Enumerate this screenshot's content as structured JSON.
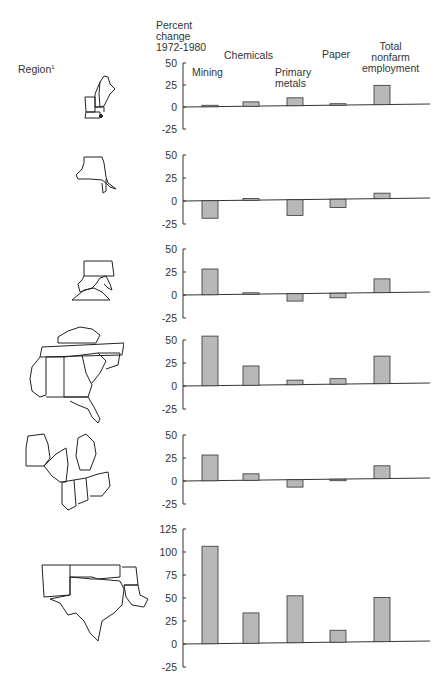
{
  "header": {
    "y_label_lines": [
      "Percent",
      "change",
      "1972-1980"
    ],
    "region_label": "Region",
    "region_footnote": "1",
    "categories": [
      {
        "key": "mining",
        "lines": [
          "Mining"
        ]
      },
      {
        "key": "chemicals",
        "lines": [
          "Chemicals"
        ]
      },
      {
        "key": "primary_metals",
        "lines": [
          "Primary",
          "metals"
        ]
      },
      {
        "key": "paper",
        "lines": [
          "Paper"
        ]
      },
      {
        "key": "total",
        "lines": [
          "Total",
          "nonfarm",
          "employment"
        ]
      }
    ]
  },
  "colors": {
    "bar_fill": "#b8b8b8",
    "bar_stroke": "#333333",
    "axis": "#333333"
  },
  "chart_data": [
    {
      "type": "bar",
      "region_map": "new-england",
      "title": "",
      "xlabel": "",
      "ylabel": "Percent change 1972-1980",
      "categories": [
        "Mining",
        "Chemicals",
        "Primary metals",
        "Paper",
        "Total nonfarm employment"
      ],
      "values": [
        0,
        5,
        9,
        1,
        22
      ],
      "yticks": [
        50,
        25,
        0,
        -25
      ],
      "ylim": [
        -25,
        50
      ],
      "grid": false
    },
    {
      "type": "bar",
      "region_map": "new-york-new-jersey",
      "categories": [
        "Mining",
        "Chemicals",
        "Primary metals",
        "Paper",
        "Total nonfarm employment"
      ],
      "values": [
        -19,
        2,
        -17,
        -9,
        6
      ],
      "yticks": [
        50,
        25,
        0,
        -25
      ],
      "ylim": [
        -25,
        50
      ],
      "grid": false
    },
    {
      "type": "bar",
      "region_map": "mid-atlantic",
      "categories": [
        "Mining",
        "Chemicals",
        "Primary metals",
        "Paper",
        "Total nonfarm employment"
      ],
      "values": [
        28,
        1,
        -8,
        -5,
        15
      ],
      "yticks": [
        50,
        25,
        0,
        -25
      ],
      "ylim": [
        -25,
        50
      ],
      "grid": false
    },
    {
      "type": "bar",
      "region_map": "southeast",
      "categories": [
        "Mining",
        "Chemicals",
        "Primary metals",
        "Paper",
        "Total nonfarm employment"
      ],
      "values": [
        54,
        21,
        5,
        6,
        30
      ],
      "yticks": [
        50,
        25,
        0,
        -25
      ],
      "ylim": [
        -25,
        50
      ],
      "grid": false
    },
    {
      "type": "bar",
      "region_map": "great-lakes",
      "categories": [
        "Mining",
        "Chemicals",
        "Primary metals",
        "Paper",
        "Total nonfarm employment"
      ],
      "values": [
        28,
        7,
        -8,
        -1,
        14
      ],
      "yticks": [
        50,
        25,
        0,
        -25
      ],
      "ylim": [
        -25,
        50
      ],
      "grid": false
    },
    {
      "type": "bar",
      "region_map": "southwest",
      "categories": [
        "Mining",
        "Chemicals",
        "Primary metals",
        "Paper",
        "Total nonfarm employment"
      ],
      "values": [
        106,
        33,
        51,
        13,
        48
      ],
      "yticks": [
        125,
        100,
        75,
        50,
        25,
        0,
        -25
      ],
      "ylim": [
        -25,
        125
      ],
      "grid": false
    }
  ]
}
